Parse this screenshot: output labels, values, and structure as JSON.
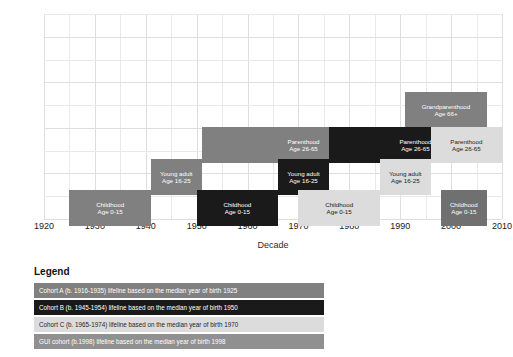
{
  "axes": {
    "ylabel": "Life stage",
    "xlabel": "Decade",
    "xticks": [
      "1920",
      "1930",
      "1940",
      "1950",
      "1960",
      "1970",
      "1980",
      "1990",
      "2000",
      "2010"
    ],
    "xlim": [
      1920,
      2010
    ],
    "ylim": [
      0,
      9
    ]
  },
  "legend": {
    "title": "Legend",
    "rows": [
      {
        "text": "Cohort A (b. 1916-1935) lifeline based on the median year of birth 1925",
        "color": "#808080",
        "dark_text": false
      },
      {
        "text": "Cohort B (b. 1945-1954) lifeline based on the median year of birth 1950",
        "color": "#1a1a1a",
        "dark_text": false
      },
      {
        "text": "Cohort C (b. 1965-1974) lifeline based on the median year of birth 1970",
        "color": "#dcdcdc",
        "dark_text": true
      },
      {
        "text": "GUI cohort (b.1998) lifeline based on the median year of birth 1998",
        "color": "#909090",
        "dark_text": false
      }
    ]
  },
  "chart_data": {
    "type": "bar",
    "title": "",
    "xlabel": "Decade",
    "ylabel": "Life stage",
    "xlim": [
      1920,
      2010
    ],
    "ylim": [
      0,
      9
    ],
    "grid": true,
    "legend_position": "below",
    "series": [
      {
        "name": "Cohort A (b. 1916-1935) lifeline based on the median year of birth 1925",
        "color": "#808080",
        "dark_text": false,
        "bars": [
          {
            "stage": "Childhood",
            "age": "Age 0-15",
            "x_start": 1925,
            "x_end": 1941,
            "level": 1
          },
          {
            "stage": "Young adult",
            "age": "Age 16-25",
            "x_start": 1941,
            "x_end": 1951,
            "level": 2
          },
          {
            "stage": "Parenthood",
            "age": "Age 26-65",
            "x_start": 1951,
            "x_end": 1991,
            "level": 3
          },
          {
            "stage": "Grandparenthood",
            "age": "Age 66+",
            "x_start": 1991,
            "x_end": 2007,
            "level": 4
          }
        ]
      },
      {
        "name": "Cohort B (b. 1945-1954) lifeline based on the median year of birth 1950",
        "color": "#1a1a1a",
        "dark_text": false,
        "bars": [
          {
            "stage": "Childhood",
            "age": "Age 0-15",
            "x_start": 1950,
            "x_end": 1966,
            "level": 1
          },
          {
            "stage": "Young adult",
            "age": "Age 16-25",
            "x_start": 1966,
            "x_end": 1976,
            "level": 2
          },
          {
            "stage": "Parenthood",
            "age": "Age 26-65",
            "x_start": 1976,
            "x_end": 2010,
            "level": 3
          }
        ]
      },
      {
        "name": "Cohort C (b. 1965-1974) lifeline based on the median year of birth 1970",
        "color": "#dcdcdc",
        "dark_text": true,
        "bars": [
          {
            "stage": "Childhood",
            "age": "Age 0-15",
            "x_start": 1970,
            "x_end": 1986,
            "level": 1
          },
          {
            "stage": "Young adult",
            "age": "Age 16-25",
            "x_start": 1986,
            "x_end": 1996,
            "level": 2
          },
          {
            "stage": "Parenthood",
            "age": "Age 26-65",
            "x_start": 1996,
            "x_end": 2010,
            "level": 3
          }
        ]
      },
      {
        "name": "GUI cohort (b.1998) lifeline based on the median year of birth 1998",
        "color": "#707070",
        "dark_text": false,
        "bars": [
          {
            "stage": "Childhood",
            "age": "Age 0-15",
            "x_start": 1998,
            "x_end": 2007,
            "level": 1
          }
        ]
      }
    ]
  }
}
